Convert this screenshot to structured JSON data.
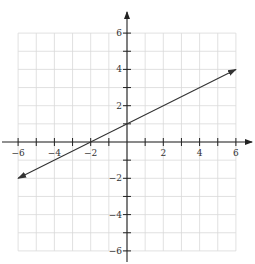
{
  "chart_data": {
    "type": "line",
    "title": "",
    "xlabel": "",
    "ylabel": "",
    "xlim": [
      -6,
      6
    ],
    "ylim": [
      -6,
      6
    ],
    "grid": true,
    "x_ticks": [
      -6,
      -4,
      -2,
      2,
      4,
      6
    ],
    "y_ticks": [
      6,
      4,
      2,
      -2,
      -4,
      -6
    ],
    "x_tick_labels": [
      "−6",
      "−4",
      "−2",
      "2",
      "4",
      "6"
    ],
    "y_tick_labels": [
      "6",
      "4",
      "2",
      "−2",
      "−4",
      "−6"
    ],
    "series": [
      {
        "name": "line",
        "equation": "y = 0.5x + 1",
        "points": [
          [
            -6,
            -2
          ],
          [
            -2,
            0
          ],
          [
            0,
            1
          ],
          [
            6,
            4
          ]
        ],
        "arrows_both_ends": true
      }
    ],
    "legend": null
  },
  "colors": {
    "grid": "#d9d9d9",
    "axis": "#222222",
    "line": "#333333"
  }
}
